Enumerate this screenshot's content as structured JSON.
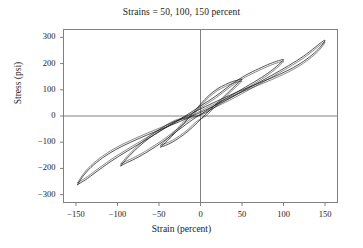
{
  "chart_data": {
    "type": "line",
    "title": "Strains = 50, 100, 150 percent",
    "xlabel": "Strain (percent)",
    "ylabel": "Stress (psi)",
    "xlim": [
      -165,
      165
    ],
    "ylim": [
      -330,
      330
    ],
    "xticks": [
      -150,
      -100,
      -50,
      0,
      50,
      100,
      150
    ],
    "xtick_labels": [
      "−150",
      "−100",
      "−50",
      "0",
      "50",
      "100",
      "150"
    ],
    "yticks": [
      300,
      200,
      100,
      0,
      -100,
      -200,
      -300
    ],
    "ytick_labels": [
      "300",
      "200",
      "100",
      "0",
      "−100",
      "−200",
      "−300"
    ],
    "grid": false,
    "legend": "none",
    "axis_lines": {
      "x_zero": true,
      "y_zero": true,
      "color": "#808080"
    },
    "curve_color": "#1a1a1a",
    "frame_color": "#808080",
    "series": [
      {
        "name": "50 percent strain loop",
        "amplitude_strain": 50,
        "peak_stress": 140,
        "min_stress": -118,
        "upper_branch": [
          [
            -48,
            -118
          ],
          [
            -40,
            -95
          ],
          [
            -30,
            -62
          ],
          [
            -20,
            -28
          ],
          [
            -10,
            8
          ],
          [
            0,
            45
          ],
          [
            10,
            78
          ],
          [
            20,
            103
          ],
          [
            30,
            120
          ],
          [
            38,
            131
          ],
          [
            45,
            137
          ],
          [
            50,
            140
          ]
        ],
        "lower_branch": [
          [
            50,
            140
          ],
          [
            44,
            122
          ],
          [
            36,
            98
          ],
          [
            27,
            70
          ],
          [
            17,
            40
          ],
          [
            6,
            6
          ],
          [
            -4,
            -26
          ],
          [
            -15,
            -58
          ],
          [
            -25,
            -82
          ],
          [
            -34,
            -100
          ],
          [
            -42,
            -112
          ],
          [
            -48,
            -118
          ]
        ]
      },
      {
        "name": "100 percent strain loop",
        "amplitude_strain": 100,
        "peak_stress": 215,
        "min_stress": -190,
        "upper_branch": [
          [
            -96,
            -190
          ],
          [
            -88,
            -160
          ],
          [
            -76,
            -122
          ],
          [
            -62,
            -85
          ],
          [
            -48,
            -55
          ],
          [
            -32,
            -25
          ],
          [
            -16,
            5
          ],
          [
            0,
            38
          ],
          [
            18,
            75
          ],
          [
            36,
            118
          ],
          [
            54,
            155
          ],
          [
            70,
            180
          ],
          [
            84,
            200
          ],
          [
            94,
            211
          ],
          [
            100,
            215
          ]
        ],
        "lower_branch": [
          [
            100,
            215
          ],
          [
            94,
            196
          ],
          [
            84,
            170
          ],
          [
            70,
            140
          ],
          [
            54,
            110
          ],
          [
            38,
            80
          ],
          [
            22,
            50
          ],
          [
            6,
            18
          ],
          [
            -10,
            -15
          ],
          [
            -26,
            -52
          ],
          [
            -44,
            -95
          ],
          [
            -62,
            -133
          ],
          [
            -78,
            -162
          ],
          [
            -90,
            -180
          ],
          [
            -96,
            -190
          ]
        ]
      },
      {
        "name": "150 percent strain loop",
        "amplitude_strain": 150,
        "peak_stress": 288,
        "min_stress": -262,
        "upper_branch": [
          [
            -148,
            -262
          ],
          [
            -142,
            -232
          ],
          [
            -132,
            -196
          ],
          [
            -118,
            -160
          ],
          [
            -102,
            -128
          ],
          [
            -84,
            -100
          ],
          [
            -64,
            -72
          ],
          [
            -44,
            -46
          ],
          [
            -24,
            -20
          ],
          [
            -4,
            8
          ],
          [
            16,
            38
          ],
          [
            38,
            72
          ],
          [
            60,
            110
          ],
          [
            84,
            152
          ],
          [
            106,
            192
          ],
          [
            124,
            228
          ],
          [
            138,
            262
          ],
          [
            146,
            282
          ],
          [
            150,
            288
          ]
        ],
        "lower_branch": [
          [
            150,
            288
          ],
          [
            144,
            262
          ],
          [
            134,
            232
          ],
          [
            120,
            200
          ],
          [
            104,
            172
          ],
          [
            86,
            146
          ],
          [
            66,
            120
          ],
          [
            46,
            94
          ],
          [
            26,
            66
          ],
          [
            6,
            36
          ],
          [
            -14,
            4
          ],
          [
            -36,
            -34
          ],
          [
            -58,
            -76
          ],
          [
            -82,
            -122
          ],
          [
            -104,
            -165
          ],
          [
            -122,
            -205
          ],
          [
            -136,
            -238
          ],
          [
            -145,
            -256
          ],
          [
            -148,
            -262
          ]
        ]
      }
    ]
  }
}
